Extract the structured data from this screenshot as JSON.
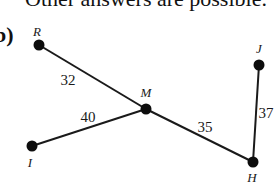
{
  "header": {
    "text": "Other answers are possible."
  },
  "part": {
    "label": "b)"
  },
  "graph": {
    "vertices": [
      {
        "id": "R",
        "label": "R",
        "x": 39,
        "y": 45,
        "lx": 37,
        "ly": 36
      },
      {
        "id": "M",
        "label": "M",
        "x": 146,
        "y": 109,
        "lx": 146,
        "ly": 97
      },
      {
        "id": "I",
        "label": "I",
        "x": 32,
        "y": 146,
        "lx": 30,
        "ly": 167
      },
      {
        "id": "H",
        "label": "H",
        "x": 253,
        "y": 162,
        "lx": 252,
        "ly": 182
      },
      {
        "id": "J",
        "label": "J",
        "x": 259,
        "y": 65,
        "lx": 259,
        "ly": 53
      }
    ],
    "edges": [
      {
        "from": "R",
        "to": "M",
        "weight": "32",
        "lx": 68,
        "ly": 85
      },
      {
        "from": "I",
        "to": "M",
        "weight": "40",
        "lx": 88,
        "ly": 122
      },
      {
        "from": "M",
        "to": "H",
        "weight": "35",
        "lx": 205,
        "ly": 132
      },
      {
        "from": "H",
        "to": "J",
        "weight": "37",
        "lx": 266,
        "ly": 118
      }
    ],
    "colors": {
      "line": "#1a1a1a",
      "vertex": "#0d0d0d"
    }
  }
}
